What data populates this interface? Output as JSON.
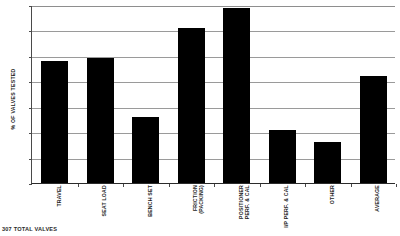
{
  "chart_data": {
    "type": "bar",
    "title": "",
    "subtitle": "",
    "xlabel": "",
    "ylabel": "% OF VALVES TESTED",
    "ylim": [
      0,
      70
    ],
    "yticks": [
      0,
      10,
      20,
      30,
      40,
      50,
      60,
      70
    ],
    "ytick_labels": [
      "0",
      "10",
      "20",
      "30",
      "40",
      "50",
      "60",
      "70"
    ],
    "grid": "horizontal",
    "legend": "none",
    "bar_color": "#000000",
    "categories": [
      "TRAVEL",
      "SEAT LOAD",
      "BENCH SET",
      "FRICTION\n(PACKING)",
      "POSITIONER\nPERF. & CAL",
      "I/P PERF. & CAL",
      "OTHER",
      "AVERAGE"
    ],
    "values": [
      48,
      49,
      26,
      61,
      69,
      21,
      16,
      42
    ],
    "annotations": [
      "307 TOTAL VALVES"
    ]
  },
  "footnote": {
    "text": "307 TOTAL VALVES"
  }
}
